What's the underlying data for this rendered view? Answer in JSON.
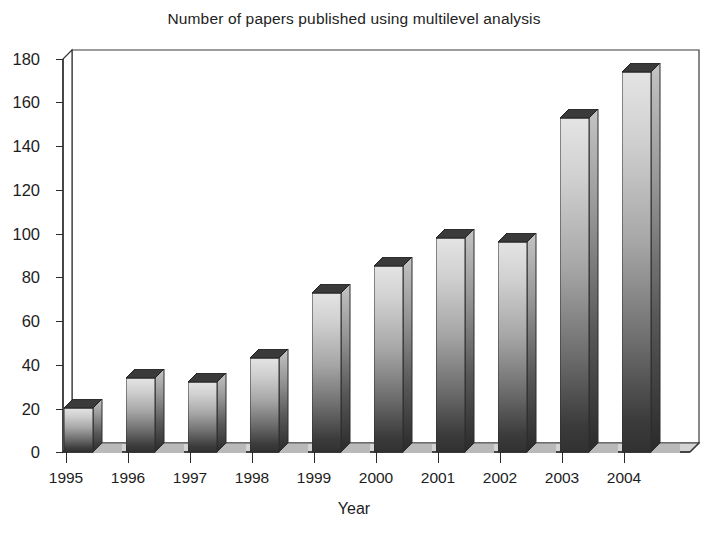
{
  "chart_data": {
    "type": "bar",
    "title": "Number of papers published using multilevel analysis",
    "xlabel": "Year",
    "ylabel": "",
    "categories": [
      "1995",
      "1996",
      "1997",
      "1998",
      "1999",
      "2000",
      "2001",
      "2002",
      "2003",
      "2004"
    ],
    "values": [
      20,
      34,
      32,
      43,
      73,
      85,
      98,
      96,
      153,
      174
    ],
    "ylim": [
      0,
      180
    ],
    "ytick_values": [
      0,
      20,
      40,
      60,
      80,
      100,
      120,
      140,
      160,
      180
    ],
    "ytick_labels": [
      "0",
      "20",
      "40",
      "60",
      "80",
      "100",
      "120",
      "140",
      "160",
      "180"
    ],
    "grid": false,
    "legend": null,
    "style": "3d-column",
    "bar_fill_top_color": "#e2e2e2",
    "bar_fill_bottom_color": "#333333",
    "axis_color": "#2b2b2b",
    "background_color": "#ffffff"
  }
}
